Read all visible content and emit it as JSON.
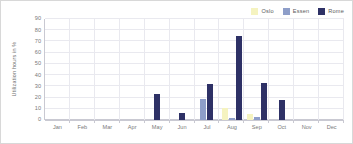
{
  "chart_data": {
    "type": "bar",
    "title": "",
    "xlabel": "",
    "ylabel": "Utilization hours in %",
    "ylim": [
      0,
      90
    ],
    "yticks": [
      90,
      80,
      70,
      60,
      50,
      40,
      30,
      20,
      10,
      0
    ],
    "grid": true,
    "legend_position": "top-right",
    "categories": [
      "Jan",
      "Feb",
      "Mar",
      "Apr",
      "May",
      "Jun",
      "Jul",
      "Aug",
      "Sep",
      "Oct",
      "Nov",
      "Dec"
    ],
    "series": [
      {
        "name": "Oslo",
        "color": "#f5f3c0",
        "values": [
          0,
          0,
          0,
          0,
          0,
          0,
          0,
          11,
          5,
          0,
          0,
          0
        ]
      },
      {
        "name": "Essen",
        "color": "#8e9ec9",
        "values": [
          0,
          0,
          0,
          0,
          0,
          0,
          19,
          2,
          3,
          0,
          0,
          0
        ]
      },
      {
        "name": "Rome",
        "color": "#2e3166",
        "values": [
          0,
          0,
          0,
          0,
          23,
          6,
          32,
          75,
          33,
          18,
          0,
          0
        ]
      }
    ]
  },
  "colors": {
    "oslo": "#f5f3c0",
    "essen": "#8e9ec9",
    "rome": "#2e3166",
    "grid": "#e9e9ef",
    "axis": "#c9c9d2",
    "tick_text": "#7a7a7a",
    "legend_text": "#5a5a5a",
    "border": "#d8d8d8",
    "background": "#ffffff"
  }
}
